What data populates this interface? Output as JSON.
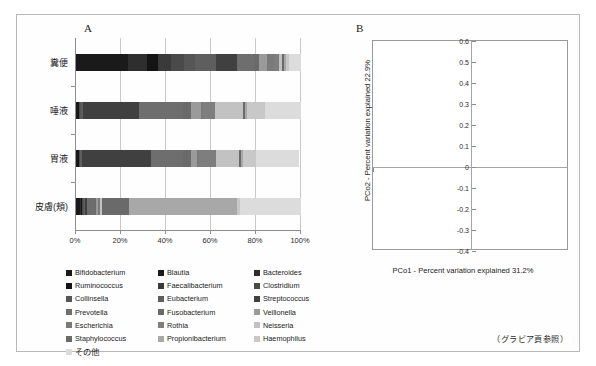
{
  "figure": {
    "note": "（グラビア頁参照）"
  },
  "panel_a": {
    "letter": "A",
    "categories": [
      "糞便",
      "唾液",
      "胃液",
      "皮膚(頬)"
    ],
    "x_ticks": [
      "0%",
      "20%",
      "40%",
      "60%",
      "80%",
      "100%"
    ],
    "legend": [
      {
        "label": "Bifidobacterium",
        "color": "#1a1a1a"
      },
      {
        "label": "Blautia",
        "color": "#1a1a1a"
      },
      {
        "label": "Bacteroides",
        "color": "#2e2e2e"
      },
      {
        "label": "Ruminococcus",
        "color": "#141414"
      },
      {
        "label": "Faecalibacterium",
        "color": "#3a3a3a"
      },
      {
        "label": "Clostridium",
        "color": "#4a4a4a"
      },
      {
        "label": "Collinsella",
        "color": "#565656"
      },
      {
        "label": "Eubacterium",
        "color": "#5e5e5e"
      },
      {
        "label": "Streptococcus",
        "color": "#404040"
      },
      {
        "label": "Prevotella",
        "color": "#6e6e6e"
      },
      {
        "label": "Fusobacterium",
        "color": "#6a6a6a"
      },
      {
        "label": "Veillonella",
        "color": "#9a9a9a"
      },
      {
        "label": "Escherichia",
        "color": "#7a7a7a"
      },
      {
        "label": "Rothia",
        "color": "#7e7e7e"
      },
      {
        "label": "Neisseria",
        "color": "#c2c2c2"
      },
      {
        "label": "Staphylococcus",
        "color": "#6a6a6a"
      },
      {
        "label": "Propionibacterium",
        "color": "#a8a8a8"
      },
      {
        "label": "Haemophilus",
        "color": "#c8c8c8"
      },
      {
        "label": "その他",
        "color": "#dcdcdc"
      }
    ]
  },
  "panel_b": {
    "letter": "B",
    "x_title": "PCo1 - Percent variation explained 31.2%",
    "y_title": "PCo2 - Percent variation explained 22.9%",
    "x_ticks": [
      "-0.6",
      "-0.4",
      "-0.2",
      "0",
      "0.2",
      "0.4",
      "0.6"
    ],
    "y_ticks": [
      "-0.4",
      "-0.3",
      "-0.2",
      "-0.1",
      "0",
      "0.1",
      "0.2",
      "0.3",
      "0.4",
      "0.5",
      "0.6"
    ],
    "group_labels": [
      {
        "text": "糞便",
        "x": -0.33,
        "y": 0.43
      },
      {
        "text": "皮膚(頬)",
        "x": -0.36,
        "y": -0.33
      },
      {
        "text": "唾液/胃液",
        "x": 0.34,
        "y": -0.15
      }
    ]
  },
  "chart_data": [
    {
      "type": "bar",
      "orientation": "horizontal",
      "stacked": true,
      "title": "A",
      "xlabel": "",
      "ylabel": "",
      "xlim": [
        0,
        100
      ],
      "x_tick_values": [
        0,
        20,
        40,
        60,
        80,
        100
      ],
      "x_tick_labels": [
        "0%",
        "20%",
        "40%",
        "60%",
        "80%",
        "100%"
      ],
      "categories": [
        "糞便",
        "唾液",
        "胃液",
        "皮膚(頬)"
      ],
      "legend_position": "below",
      "grid": true,
      "series": [
        {
          "name": "Bifidobacterium",
          "color": "#1a1a1a",
          "values": [
            14.0,
            0.5,
            0.4,
            1.5
          ]
        },
        {
          "name": "Blautia",
          "color": "#1a1a1a",
          "values": [
            9.0,
            0.3,
            0.3,
            0.3
          ]
        },
        {
          "name": "Bacteroides",
          "color": "#2e2e2e",
          "values": [
            8.5,
            0.3,
            0.3,
            0.4
          ]
        },
        {
          "name": "Ruminococcus",
          "color": "#141414",
          "values": [
            5.0,
            0.2,
            0.2,
            0.3
          ]
        },
        {
          "name": "Faecalibacterium",
          "color": "#3a3a3a",
          "values": [
            5.5,
            0.2,
            0.2,
            0.3
          ]
        },
        {
          "name": "Clostridium",
          "color": "#4a4a4a",
          "values": [
            6.0,
            0.3,
            0.3,
            0.4
          ]
        },
        {
          "name": "Collinsella",
          "color": "#565656",
          "values": [
            5.0,
            0.3,
            0.3,
            0.4
          ]
        },
        {
          "name": "Eubacterium",
          "color": "#5e5e5e",
          "values": [
            9.0,
            1.0,
            0.5,
            0.5
          ]
        },
        {
          "name": "Streptococcus",
          "color": "#404040",
          "values": [
            9.5,
            25.0,
            31.0,
            1.0
          ]
        },
        {
          "name": "Prevotella",
          "color": "#6e6e6e",
          "values": [
            7.5,
            19.5,
            14.0,
            3.5
          ]
        },
        {
          "name": "Fusobacterium",
          "color": "#6a6a6a",
          "values": [
            2.5,
            3.5,
            3.5,
            0.5
          ]
        },
        {
          "name": "Veillonella",
          "color": "#9a9a9a",
          "values": [
            3.5,
            4.5,
            3.0,
            0.5
          ]
        },
        {
          "name": "Escherichia",
          "color": "#7a7a7a",
          "values": [
            3.0,
            1.0,
            0.8,
            0.5
          ]
        },
        {
          "name": "Rothia",
          "color": "#7e7e7e",
          "values": [
            2.0,
            5.0,
            7.5,
            0.5
          ]
        },
        {
          "name": "Neisseria",
          "color": "#c2c2c2",
          "values": [
            1.5,
            12.5,
            10.0,
            1.0
          ]
        },
        {
          "name": "Staphylococcus",
          "color": "#6a6a6a",
          "values": [
            1.0,
            1.0,
            1.0,
            12.0
          ]
        },
        {
          "name": "Propionibacterium",
          "color": "#a8a8a8",
          "values": [
            1.0,
            1.0,
            1.0,
            48.0
          ]
        },
        {
          "name": "Haemophilus",
          "color": "#c8c8c8",
          "values": [
            1.0,
            8.0,
            5.5,
            1.5
          ]
        },
        {
          "name": "その他",
          "color": "#dcdcdc",
          "values": [
            5.5,
            15.7,
            19.2,
            26.9
          ]
        }
      ]
    },
    {
      "type": "scatter",
      "title": "B",
      "xlabel": "PCo1 - Percent variation explained 31.2%",
      "ylabel": "PCo2 - Percent variation explained 22.9%",
      "xlim": [
        -0.6,
        0.6
      ],
      "ylim": [
        -0.4,
        0.6
      ],
      "x_tick_values": [
        -0.6,
        -0.4,
        -0.2,
        0,
        0.2,
        0.4,
        0.6
      ],
      "y_tick_values": [
        -0.4,
        -0.3,
        -0.2,
        -0.1,
        0,
        0.1,
        0.2,
        0.3,
        0.4,
        0.5,
        0.6
      ],
      "grid": false,
      "legend_position": "none",
      "series": [
        {
          "name": "糞便",
          "color": "#4a4a4a",
          "marker": "circle",
          "points": [
            [
              -0.2,
              0.56
            ],
            [
              -0.18,
              0.55
            ],
            [
              -0.22,
              0.53
            ],
            [
              -0.19,
              0.52
            ],
            [
              -0.16,
              0.53
            ],
            [
              -0.21,
              0.5
            ],
            [
              -0.17,
              0.5
            ],
            [
              -0.23,
              0.51
            ],
            [
              -0.15,
              0.51
            ],
            [
              -0.19,
              0.48
            ],
            [
              -0.16,
              0.47
            ],
            [
              -0.14,
              0.45
            ],
            [
              -0.13,
              0.44
            ],
            [
              -0.19,
              0.42
            ],
            [
              -0.09,
              0.41
            ],
            [
              -0.1,
              0.38
            ],
            [
              -0.21,
              0.36
            ],
            [
              -0.29,
              0.295
            ],
            [
              -0.145,
              -0.03
            ]
          ]
        },
        {
          "name": "皮膚(頬)",
          "color": "#232323",
          "marker": "circle",
          "points": [
            [
              -0.53,
              -0.24
            ],
            [
              -0.52,
              -0.25
            ],
            [
              -0.51,
              -0.23
            ],
            [
              -0.5,
              -0.26
            ],
            [
              -0.49,
              -0.24
            ],
            [
              -0.5,
              -0.22
            ],
            [
              -0.48,
              -0.27
            ],
            [
              -0.47,
              -0.25
            ],
            [
              -0.46,
              -0.26
            ],
            [
              -0.45,
              -0.24
            ],
            [
              -0.44,
              -0.27
            ],
            [
              -0.43,
              -0.25
            ],
            [
              -0.42,
              -0.22
            ],
            [
              -0.41,
              -0.26
            ],
            [
              -0.4,
              -0.24
            ],
            [
              -0.39,
              -0.21
            ],
            [
              -0.38,
              -0.25
            ],
            [
              -0.37,
              -0.19
            ],
            [
              -0.36,
              -0.23
            ],
            [
              -0.35,
              -0.17
            ],
            [
              -0.34,
              -0.22
            ],
            [
              -0.33,
              -0.2
            ],
            [
              -0.32,
              -0.24
            ],
            [
              -0.31,
              -0.16
            ],
            [
              -0.3,
              -0.21
            ],
            [
              -0.29,
              -0.23
            ],
            [
              -0.28,
              -0.18
            ],
            [
              -0.27,
              -0.13
            ],
            [
              -0.26,
              -0.2
            ],
            [
              -0.25,
              -0.22
            ],
            [
              -0.235,
              -0.165
            ],
            [
              -0.22,
              -0.19
            ],
            [
              -0.21,
              -0.235
            ],
            [
              -0.2,
              -0.145
            ],
            [
              -0.185,
              -0.19
            ],
            [
              -0.175,
              -0.225
            ],
            [
              -0.16,
              -0.175
            ],
            [
              -0.15,
              -0.205
            ],
            [
              -0.14,
              -0.1
            ],
            [
              -0.13,
              -0.125
            ],
            [
              -0.115,
              -0.095
            ],
            [
              -0.1,
              -0.15
            ],
            [
              -0.09,
              -0.11
            ],
            [
              -0.075,
              -0.235
            ],
            [
              -0.06,
              -0.1
            ],
            [
              -0.045,
              -0.135
            ],
            [
              -0.03,
              -0.095
            ],
            [
              -0.015,
              -0.1
            ],
            [
              0.005,
              -0.095
            ],
            [
              0.02,
              -0.1
            ],
            [
              0.035,
              -0.095
            ]
          ]
        },
        {
          "name": "唾液/胃液",
          "color": "#232323",
          "marker": "circle",
          "points": [
            [
              0.06,
              -0.16
            ],
            [
              0.095,
              -0.15
            ],
            [
              0.13,
              -0.145
            ],
            [
              0.15,
              -0.1
            ],
            [
              0.165,
              -0.13
            ],
            [
              0.18,
              -0.155
            ],
            [
              0.2,
              -0.085
            ],
            [
              0.21,
              -0.12
            ],
            [
              0.225,
              -0.06
            ],
            [
              0.235,
              -0.1
            ],
            [
              0.245,
              -0.135
            ],
            [
              0.255,
              -0.045
            ],
            [
              0.265,
              -0.08
            ],
            [
              0.275,
              -0.115
            ],
            [
              0.285,
              -0.035
            ],
            [
              0.29,
              -0.065
            ],
            [
              0.3,
              -0.1
            ],
            [
              0.305,
              -0.02
            ],
            [
              0.315,
              -0.05
            ],
            [
              0.32,
              -0.085
            ],
            [
              0.26,
              0.02
            ],
            [
              0.27,
              -0.005
            ],
            [
              0.285,
              0.01
            ],
            [
              0.3,
              -0.015
            ],
            [
              0.25,
              -0.025
            ],
            [
              0.335,
              -0.06
            ],
            [
              0.345,
              -0.03
            ],
            [
              0.35,
              -0.075
            ]
          ]
        },
        {
          "name": "唾液/胃液 (open)",
          "color": "#ffffff",
          "marker": "circle-open",
          "points": [
            [
              0.295,
              0.005
            ],
            [
              0.315,
              0.0
            ],
            [
              0.33,
              -0.015
            ],
            [
              0.345,
              -0.005
            ],
            [
              0.355,
              -0.025
            ],
            [
              0.305,
              -0.03
            ],
            [
              0.325,
              -0.04
            ],
            [
              0.34,
              -0.055
            ],
            [
              0.36,
              -0.045
            ],
            [
              0.355,
              -0.065
            ],
            [
              0.37,
              -0.03
            ],
            [
              0.315,
              -0.055
            ]
          ]
        },
        {
          "name": "糞便 (open)",
          "color": "#ffffff",
          "marker": "circle-open",
          "points": [
            [
              -0.195,
              0.545
            ],
            [
              -0.175,
              0.535
            ],
            [
              -0.205,
              0.515
            ],
            [
              -0.185,
              0.505
            ]
          ]
        }
      ]
    }
  ]
}
